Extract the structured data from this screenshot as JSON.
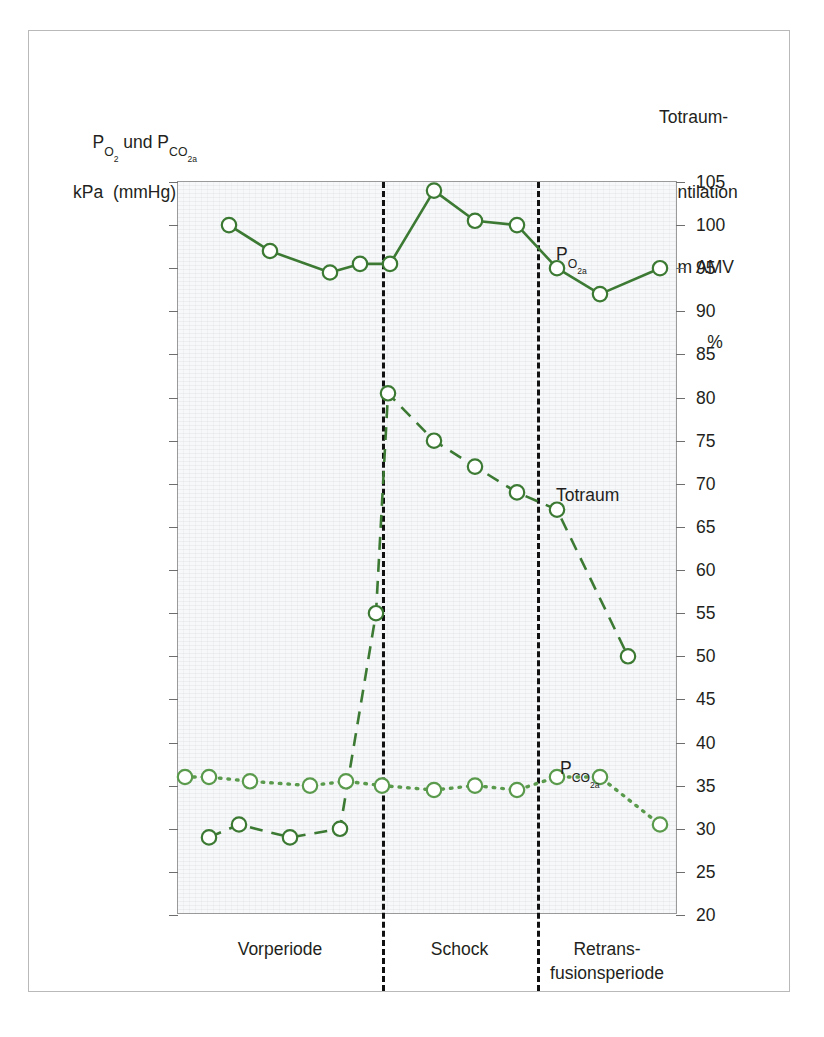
{
  "figure": {
    "left_axis_caption_line1": "Pₒ₂ und Pᴄₒ₂ₐ",
    "left_axis_caption_line2": "kPa  (mmHg)",
    "right_axis_caption_line1": "Totraum-",
    "right_axis_caption_line2": "ventilation",
    "right_axis_caption_line3": "vom AMV",
    "right_axis_caption_unit": "%",
    "accent_color": "#3c7a34",
    "divider_color": "#111111",
    "plot_bg": "#f7f8f9"
  },
  "chart_data": {
    "type": "line",
    "title": "",
    "xlabel": "",
    "ylabel": "P_O2 und P_CO2a  kPa (mmHg)",
    "y2label": "Totraumventilation vom AMV %",
    "ylim": [
      20,
      105
    ],
    "grid": false,
    "legend": "inline-annotations",
    "y_left_ticks": [
      "14,00 – 105",
      "13,33 – 100",
      "12,67 – 95",
      "12,00 – 90",
      "11,33 – 85",
      "10,67 – 80",
      "10,00 – 75",
      "9,33 – 70",
      "8,67 – 65",
      "8,00 – 60",
      "7,33 – 55",
      "6,67 – 50",
      "6,00 – 45",
      "5,33 – 40",
      "4,67 – 35",
      "4,00 – 30",
      "3,33 – 25",
      "2,67 – 20"
    ],
    "y_left_values": [
      105,
      100,
      95,
      90,
      85,
      80,
      75,
      70,
      65,
      60,
      55,
      50,
      45,
      40,
      35,
      30,
      25,
      20
    ],
    "y_right_ticks": [
      "105",
      "100",
      "95",
      "90",
      "85",
      "80",
      "75",
      "70",
      "65",
      "60",
      "55",
      "50",
      "45",
      "40",
      "35",
      "30",
      "25",
      "20"
    ],
    "y_right_values": [
      105,
      100,
      95,
      90,
      85,
      80,
      75,
      70,
      65,
      60,
      55,
      50,
      45,
      40,
      35,
      30,
      25,
      20
    ],
    "x_categories": [
      {
        "label": "Vorperiode",
        "label2": ""
      },
      {
        "label": "Schock",
        "label2": ""
      },
      {
        "label": "Retrans-",
        "label2": "fusionsperiode"
      }
    ],
    "phase_boundaries_x": [
      0.408,
      0.718
    ],
    "series": [
      {
        "name": "P_O2a",
        "annotation": "Pₒ₂ₐ",
        "style": "solid",
        "color": "#3c7a34",
        "x": [
          0.102,
          0.184,
          0.304,
          0.364,
          0.424,
          0.512,
          0.594,
          0.678,
          0.758,
          0.844,
          0.964
        ],
        "values": [
          100,
          97,
          94.5,
          95.5,
          95.5,
          104,
          100.5,
          100,
          95,
          92,
          95
        ]
      },
      {
        "name": "Totraum",
        "annotation": "Totraum",
        "style": "dashed",
        "color": "#3c7a34",
        "x": [
          0.062,
          0.122,
          0.224,
          0.324,
          0.396,
          0.42,
          0.512,
          0.594,
          0.678,
          0.758,
          0.9
        ],
        "values": [
          29,
          30.5,
          29,
          30,
          55,
          80.5,
          75,
          72,
          69,
          67,
          50
        ]
      },
      {
        "name": "P_CO2a",
        "annotation": "Pᴄₒ₂ₐ",
        "style": "dotted",
        "color": "#5a9a4c",
        "x": [
          0.014,
          0.062,
          0.144,
          0.264,
          0.336,
          0.408,
          0.512,
          0.594,
          0.678,
          0.758,
          0.844,
          0.964
        ],
        "values": [
          36,
          36,
          35.5,
          35,
          35.5,
          35,
          34.5,
          35,
          34.5,
          36,
          36,
          30.5
        ]
      }
    ]
  }
}
